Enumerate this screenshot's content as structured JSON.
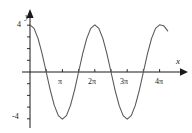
{
  "figure": {
    "name": "cosine-graph",
    "background_color": "#ffffff",
    "axis_color": "#1a1a1a",
    "curve_color": "#5a5a5a"
  },
  "axes": {
    "y_axis_label": "y",
    "x_axis_label": "x",
    "y_ticks": [
      {
        "label": "4",
        "value": 4
      },
      {
        "label": "-4",
        "value": -4
      }
    ],
    "x_ticks": [
      {
        "label": "π",
        "value": 3.14159
      },
      {
        "label": "2π",
        "value": 6.28319
      },
      {
        "label": "3π",
        "value": 9.42478
      },
      {
        "label": "4π",
        "value": 12.56637
      }
    ]
  },
  "chart_data": {
    "type": "line",
    "title": "",
    "xlabel": "x",
    "ylabel": "y",
    "xlim": [
      0,
      13.6
    ],
    "ylim": [
      -5.2,
      5.2
    ],
    "grid": false,
    "legend": "none",
    "expression": "y = 4 cos(x)",
    "amplitude": 4,
    "period": 6.28319,
    "x_tick_labels": [
      "π",
      "2π",
      "3π",
      "4π"
    ],
    "x_tick_values": [
      3.14159,
      6.28319,
      9.42478,
      12.56637
    ],
    "y_tick_labels": [
      "4",
      "-4"
    ],
    "y_tick_values": [
      4,
      -4
    ],
    "x_minor_tick_step": 1.5708,
    "y_minor_tick_step": 1,
    "series": [
      {
        "name": "4cos(x)",
        "x": [
          0,
          0.3927,
          0.7854,
          1.1781,
          1.5708,
          1.9635,
          2.3562,
          2.7489,
          3.14159,
          3.5343,
          3.927,
          4.3197,
          4.7124,
          5.1051,
          5.4978,
          5.8905,
          6.28319,
          6.6759,
          7.0686,
          7.4613,
          7.854,
          8.2467,
          8.6394,
          9.0321,
          9.42478,
          9.8175,
          10.2102,
          10.6029,
          10.9956,
          11.3883,
          11.781,
          12.1737,
          12.56637,
          12.959,
          13.35
        ],
        "y": [
          4,
          3.6955,
          2.8284,
          1.5307,
          0,
          -1.5307,
          -2.8284,
          -3.6955,
          -4,
          -3.6955,
          -2.8284,
          -1.5307,
          0,
          1.5307,
          2.8284,
          3.6955,
          4,
          3.6955,
          2.8284,
          1.5307,
          0,
          -1.5307,
          -2.8284,
          -3.6955,
          -4,
          -3.6955,
          -2.8284,
          -1.5307,
          0,
          1.5307,
          2.8284,
          3.6955,
          4,
          3.9247,
          3.48
        ]
      }
    ],
    "key_points": [
      {
        "x": 0,
        "y": 4,
        "kind": "maximum"
      },
      {
        "x": 3.14159,
        "y": -4,
        "kind": "minimum"
      },
      {
        "x": 6.28319,
        "y": 4,
        "kind": "maximum"
      },
      {
        "x": 9.42478,
        "y": -4,
        "kind": "minimum"
      },
      {
        "x": 12.56637,
        "y": 4,
        "kind": "maximum"
      }
    ]
  }
}
